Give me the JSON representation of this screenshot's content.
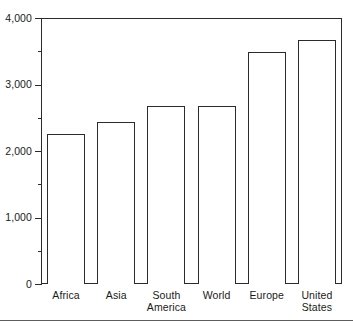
{
  "chart_data": {
    "type": "bar",
    "title": "",
    "subtitle": "",
    "xlabel": "",
    "ylabel": "",
    "categories": [
      "Africa",
      "Asia",
      "South America",
      "World",
      "Europe",
      "United States"
    ],
    "values": [
      2250,
      2440,
      2680,
      2680,
      3490,
      3670
    ],
    "ylim": [
      0,
      4000
    ],
    "y_major_ticks": [
      0,
      1000,
      2000,
      3000,
      4000
    ],
    "y_major_tick_labels": [
      "0",
      "1,000",
      "2,000",
      "3,000",
      "4,000"
    ],
    "y_minor_ticks": [
      500,
      1500,
      2500,
      3500
    ],
    "grid": false,
    "legend": false,
    "legend_position": "none",
    "bar_fill_color": "#ffffff",
    "bar_edge_color": "#2b2b2b",
    "axis_color": "#2b2b2b",
    "background_color": "#ffffff",
    "annotations": []
  },
  "axis": {
    "y_tick_labels": [
      {
        "text": "4,000",
        "value": 4000
      },
      {
        "text": "3,000",
        "value": 3000
      },
      {
        "text": "2,000",
        "value": 2000
      },
      {
        "text": "1,000",
        "value": 1000
      },
      {
        "text": "0",
        "value": 0
      }
    ],
    "x_tick_labels": [
      {
        "line1": "Africa",
        "line2": ""
      },
      {
        "line1": "Asia",
        "line2": ""
      },
      {
        "line1": "South",
        "line2": "America"
      },
      {
        "line1": "World",
        "line2": ""
      },
      {
        "line1": "Europe",
        "line2": ""
      },
      {
        "line1": "United",
        "line2": "States"
      }
    ]
  }
}
